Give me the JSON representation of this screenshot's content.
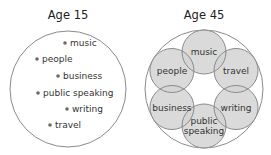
{
  "left": {
    "title": "Age 15",
    "items": [
      {
        "label": "music"
      },
      {
        "label": "people"
      },
      {
        "label": "business"
      },
      {
        "label": "public speaking"
      },
      {
        "label": "writing"
      },
      {
        "label": "travel"
      }
    ]
  },
  "right": {
    "title": "Age 45",
    "circles": [
      {
        "lines": [
          "music"
        ]
      },
      {
        "lines": [
          "travel"
        ]
      },
      {
        "lines": [
          "writing"
        ]
      },
      {
        "lines": [
          "public",
          "speaking"
        ]
      },
      {
        "lines": [
          "business"
        ]
      },
      {
        "lines": [
          "people"
        ]
      }
    ]
  },
  "colors": {
    "outline": "#8a8a8a",
    "fill": "#d4d4d4",
    "dot": "#6a6a6a",
    "text": "#333333"
  }
}
